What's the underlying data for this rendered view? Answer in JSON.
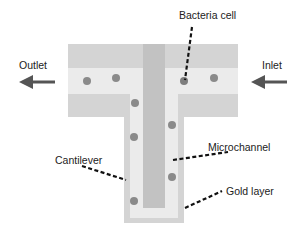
{
  "diagram": {
    "labels": {
      "bacteria_cell": "Bacteria cell",
      "outlet": "Outlet",
      "inlet": "Inlet",
      "microchannel": "Microchannel",
      "cantilever": "Cantilever",
      "gold_layer": "Gold layer"
    },
    "colors": {
      "outer_layer": "#d4d4d4",
      "gold_layer": "#ebebeb",
      "microchannel": "#bdbdbd",
      "bacteria": "#8a8a8a",
      "arrow": "#555555",
      "leader": "#111111"
    },
    "bacteria_positions": [
      [
        87,
        80
      ],
      [
        116,
        78
      ],
      [
        184,
        80
      ],
      [
        214,
        78
      ],
      [
        135,
        103
      ],
      [
        172,
        125
      ],
      [
        134,
        137
      ],
      [
        172,
        177
      ],
      [
        134,
        201
      ]
    ]
  }
}
